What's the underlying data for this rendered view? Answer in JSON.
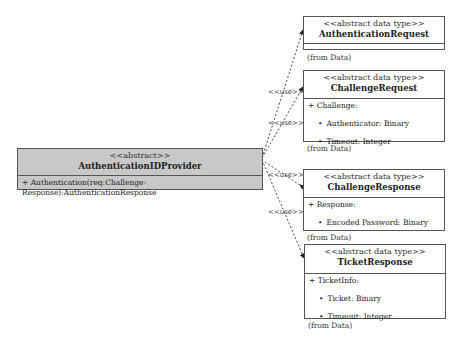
{
  "provider": {
    "stereotype": "<<abstract>>",
    "name": "AuthenticationIDProvider",
    "operation": "+ Authentication(req:Challenge-Response):AuthenticationResponse",
    "fill_color": "#c8c8c8"
  },
  "types": [
    {
      "stereotype": "<<abstract data type>>",
      "name": "AuthenticationRequest",
      "attribute": "",
      "fields": [],
      "origin": "(from Data)"
    },
    {
      "stereotype": "<<abstract data type>>",
      "name": "ChallengeRequest",
      "attribute": "+ Challenge:",
      "fields": [
        "Authenticator: Binary",
        "Timeout: Integer"
      ],
      "origin": "(from Data)"
    },
    {
      "stereotype": "<<abstract data type>>",
      "name": "ChallengeResponse",
      "attribute": "+ Response:",
      "fields": [
        "Encoded Password: Binary"
      ],
      "origin": "(from Data)"
    },
    {
      "stereotype": "<<abstract data type>>",
      "name": "TicketResponse",
      "attribute": "+ TicketInfo:",
      "fields": [
        "Ticket: Binary",
        "Timeout: Integer"
      ],
      "origin": "(from Data)"
    }
  ],
  "relations": {
    "label": "<<use>>",
    "labels": [
      "<<use>>",
      "<<use>>",
      "<<use>>",
      "<<use>>"
    ]
  }
}
